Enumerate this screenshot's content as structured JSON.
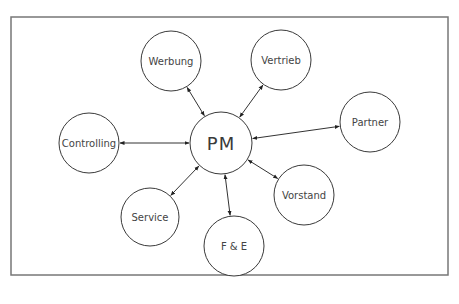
{
  "diagram": {
    "type": "hub-and-spoke",
    "frame": {
      "x": 11,
      "y": 17,
      "width": 437,
      "height": 258,
      "color": "#777777"
    },
    "center": {
      "id": "pm",
      "label": "PM",
      "cx": 221,
      "cy": 143,
      "r": 31
    },
    "nodes": [
      {
        "id": "werbung",
        "label": "Werbung",
        "cx": 171,
        "cy": 61,
        "r": 30
      },
      {
        "id": "vertrieb",
        "label": "Vertrieb",
        "cx": 281,
        "cy": 60,
        "r": 30
      },
      {
        "id": "partner",
        "label": "Partner",
        "cx": 370,
        "cy": 122,
        "r": 30
      },
      {
        "id": "controlling",
        "label": "Controlling",
        "cx": 89,
        "cy": 143,
        "r": 30
      },
      {
        "id": "vorstand",
        "label": "Vorstand",
        "cx": 304,
        "cy": 195,
        "r": 30
      },
      {
        "id": "service",
        "label": "Service",
        "cx": 150,
        "cy": 217,
        "r": 29
      },
      {
        "id": "fe",
        "label": "F & E",
        "cx": 234,
        "cy": 246,
        "r": 30
      }
    ],
    "edges": [
      {
        "from": "pm",
        "to": "werbung",
        "direction": "both"
      },
      {
        "from": "pm",
        "to": "vertrieb",
        "direction": "both"
      },
      {
        "from": "pm",
        "to": "partner",
        "direction": "both"
      },
      {
        "from": "pm",
        "to": "controlling",
        "direction": "both"
      },
      {
        "from": "pm",
        "to": "vorstand",
        "direction": "both"
      },
      {
        "from": "pm",
        "to": "service",
        "direction": "both"
      },
      {
        "from": "pm",
        "to": "fe",
        "direction": "both"
      }
    ],
    "colors": {
      "stroke": "#3a3a3a",
      "text": "#444444",
      "background": "#ffffff"
    }
  }
}
